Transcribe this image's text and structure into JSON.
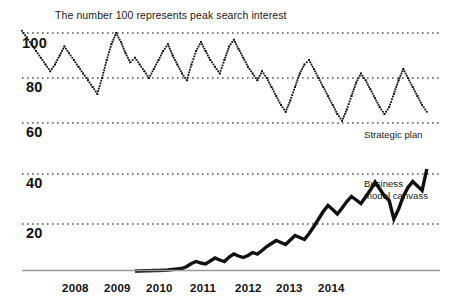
{
  "figure": {
    "title": "The number 100 represents peak search interest",
    "background": "#ffffff",
    "ink": "#111111",
    "gridline_color": "#555555",
    "axis_color": "#9a9a9a"
  },
  "axis": {
    "x_ticks": [
      "2008",
      "2009",
      "2010",
      "2011",
      "2012",
      "2013",
      "2014"
    ],
    "top_y_ticks": [
      "100",
      "80",
      "60"
    ],
    "bottom_y_ticks": [
      "40",
      "20"
    ]
  },
  "annotations": {
    "top_series_label": "Strategic plan",
    "bottom_series_label_line1": "Business",
    "bottom_series_label_line2": "model canvass"
  },
  "chart_data": {
    "type": "line",
    "title": "The number 100 represents peak search interest",
    "xlabel": "",
    "ylabel": "Search interest",
    "grid": true,
    "legend_position": "right-inline",
    "panels": [
      {
        "name": "Strategic plan",
        "style": "dotted",
        "ylim": [
          55,
          103
        ],
        "yticks": [
          60,
          80,
          100
        ],
        "xlim": [
          2008.0,
          2015.4
        ],
        "x": [
          2008.0,
          2008.083,
          2008.167,
          2008.25,
          2008.333,
          2008.417,
          2008.5,
          2008.583,
          2008.667,
          2008.75,
          2008.833,
          2008.917,
          2009.0,
          2009.083,
          2009.167,
          2009.25,
          2009.333,
          2009.417,
          2009.5,
          2009.583,
          2009.667,
          2009.75,
          2009.833,
          2009.917,
          2010.0,
          2010.083,
          2010.167,
          2010.25,
          2010.333,
          2010.417,
          2010.5,
          2010.583,
          2010.667,
          2010.75,
          2010.833,
          2010.917,
          2011.0,
          2011.083,
          2011.167,
          2011.25,
          2011.333,
          2011.417,
          2011.5,
          2011.583,
          2011.667,
          2011.75,
          2011.833,
          2011.917,
          2012.0,
          2012.083,
          2012.167,
          2012.25,
          2012.333,
          2012.417,
          2012.5,
          2012.583,
          2012.667,
          2012.75,
          2012.833,
          2012.917,
          2013.0,
          2013.083,
          2013.167,
          2013.25,
          2013.333,
          2013.417,
          2013.5,
          2013.583,
          2013.667,
          2013.75,
          2013.833,
          2013.917,
          2014.0,
          2014.083,
          2014.167,
          2014.25,
          2014.333,
          2014.417,
          2014.5,
          2014.583,
          2014.667,
          2014.75,
          2014.833,
          2014.917,
          2015.0,
          2015.083,
          2015.167
        ],
        "y": [
          101,
          98,
          95,
          92,
          89,
          86,
          83,
          86,
          90,
          94,
          91,
          88,
          85,
          82,
          79,
          76,
          73,
          80,
          88,
          95,
          100,
          96,
          91,
          87,
          89,
          86,
          83,
          80,
          84,
          88,
          92,
          95,
          90,
          86,
          82,
          79,
          86,
          92,
          96,
          92,
          88,
          85,
          82,
          88,
          94,
          97,
          93,
          89,
          85,
          82,
          79,
          83,
          80,
          76,
          72,
          68,
          65,
          70,
          76,
          82,
          86,
          88,
          84,
          80,
          76,
          72,
          68,
          64,
          61,
          66,
          72,
          78,
          82,
          79,
          75,
          71,
          67,
          64,
          67,
          73,
          79,
          84,
          80,
          76,
          72,
          68,
          65
        ]
      },
      {
        "name": "Business model canvass",
        "style": "solid",
        "ylim": [
          0,
          44
        ],
        "yticks": [
          20,
          40
        ],
        "xlim": [
          2008.0,
          2015.4
        ],
        "x": [
          2010.0,
          2010.083,
          2010.167,
          2010.25,
          2010.333,
          2010.417,
          2010.5,
          2010.583,
          2010.667,
          2010.75,
          2010.833,
          2010.917,
          2011.0,
          2011.083,
          2011.167,
          2011.25,
          2011.333,
          2011.417,
          2011.5,
          2011.583,
          2011.667,
          2011.75,
          2011.833,
          2011.917,
          2012.0,
          2012.083,
          2012.167,
          2012.25,
          2012.333,
          2012.417,
          2012.5,
          2012.583,
          2012.667,
          2012.75,
          2012.833,
          2012.917,
          2013.0,
          2013.083,
          2013.167,
          2013.25,
          2013.333,
          2013.417,
          2013.5,
          2013.583,
          2013.667,
          2013.75,
          2013.833,
          2013.917,
          2014.0,
          2014.083,
          2014.167,
          2014.25,
          2014.333,
          2014.417,
          2014.5,
          2014.583,
          2014.667,
          2014.75,
          2014.833,
          2014.917,
          2015.0,
          2015.083,
          2015.167
        ],
        "y": [
          1.2,
          1.2,
          1.3,
          1.3,
          1.4,
          1.4,
          1.5,
          1.6,
          1.8,
          2.0,
          2.2,
          3.0,
          4.2,
          5.0,
          4.4,
          4.0,
          5.2,
          6.4,
          5.6,
          5.0,
          6.8,
          8.0,
          7.2,
          6.6,
          7.4,
          8.6,
          8.0,
          9.4,
          11.0,
          12.2,
          13.4,
          12.6,
          11.8,
          13.6,
          15.4,
          14.6,
          13.8,
          16.2,
          19.0,
          22.0,
          25.0,
          27.4,
          25.8,
          24.0,
          26.4,
          29.0,
          31.0,
          29.6,
          28.2,
          30.8,
          33.6,
          36.8,
          34.0,
          31.2,
          29.4,
          22.0,
          26.0,
          31.0,
          34.6,
          37.0,
          35.2,
          33.4,
          42.0
        ]
      }
    ]
  }
}
